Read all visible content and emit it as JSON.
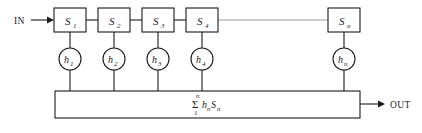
{
  "diagram": {
    "background_color": "#ffffff",
    "line_color": "#1b1b1b",
    "faint_line_color": "#9a9a9a",
    "input": {
      "label": "IN",
      "arrow_icon": "arrow-right-icon"
    },
    "output": {
      "label": "OUT",
      "arrow_icon": "arrow-right-icon"
    },
    "stages": [
      {
        "id": "s1",
        "base": "S",
        "subscript": "1",
        "x": 54,
        "y": 8,
        "w": 32,
        "h": 24
      },
      {
        "id": "s2",
        "base": "S",
        "subscript": "2",
        "x": 98,
        "y": 8,
        "w": 32,
        "h": 24
      },
      {
        "id": "s3",
        "base": "S",
        "subscript": "3",
        "x": 142,
        "y": 8,
        "w": 32,
        "h": 24
      },
      {
        "id": "s4",
        "base": "S",
        "subscript": "4",
        "x": 186,
        "y": 8,
        "w": 32,
        "h": 24
      },
      {
        "id": "sn",
        "base": "S",
        "subscript": "n",
        "x": 328,
        "y": 8,
        "w": 32,
        "h": 24
      }
    ],
    "taps": [
      {
        "id": "h1",
        "base": "h",
        "subscript": "1",
        "cx": 70,
        "cy": 59,
        "r": 11
      },
      {
        "id": "h2",
        "base": "h",
        "subscript": "2",
        "cx": 114,
        "cy": 59,
        "r": 11
      },
      {
        "id": "h3",
        "base": "h",
        "subscript": "3",
        "cx": 158,
        "cy": 59,
        "r": 11
      },
      {
        "id": "h4",
        "base": "h",
        "subscript": "4",
        "cx": 202,
        "cy": 59,
        "r": 11
      },
      {
        "id": "hn",
        "base": "h",
        "subscript": "n",
        "cx": 344,
        "cy": 59,
        "r": 11
      }
    ],
    "ellipsis_link": {
      "from_stage": "s4",
      "to_stage": "sn",
      "style": "faint-line"
    },
    "summation_bar": {
      "x": 55,
      "y": 91,
      "w": 305,
      "h": 27,
      "formula": {
        "upper_limit": "n",
        "sigma": "Σ",
        "lower_limit": "1",
        "term_base_1": "h",
        "term_sub_1": "n",
        "term_base_2": "S",
        "term_sub_2": "n"
      }
    }
  }
}
